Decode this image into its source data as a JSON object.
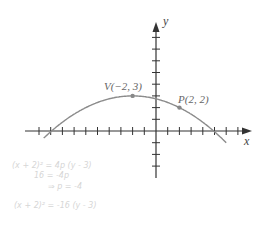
{
  "diagram": {
    "axes": {
      "x_label": "x",
      "y_label": "y",
      "tick_spacing_units": 1,
      "x_range": [
        -10,
        8
      ],
      "y_range": [
        -3,
        9
      ]
    },
    "curve": {
      "type": "parabola",
      "equation": "(x + 2)^2 = -16(y - 3)",
      "color": "#8c8c8c"
    },
    "points": [
      {
        "name": "V",
        "label": "V(−2, 3)",
        "x": -2,
        "y": 3
      },
      {
        "name": "P",
        "label": "P(2, 2)",
        "x": 2,
        "y": 2
      }
    ],
    "handwritten_notes": [
      "(x + 2)² = 4p (y - 3)",
      "16 = -4p",
      "⇒ p = -4",
      "(x + 2)² = -16 (y - 3)"
    ],
    "colors": {
      "axis": "#333333",
      "curve": "#8c8c8c",
      "point": "#888888",
      "label": "#666666",
      "handwriting": "#d6d6d6"
    }
  }
}
